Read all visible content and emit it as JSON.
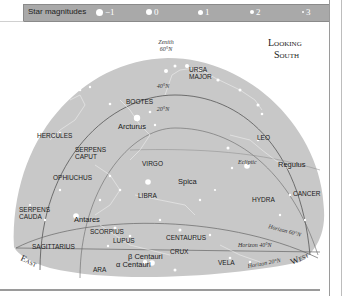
{
  "legend": {
    "title": "Star magnitudes",
    "magnitudes": [
      "−1",
      "0",
      "1",
      "2",
      "3"
    ]
  },
  "heading": {
    "line1": "Looking",
    "line2": "South"
  },
  "zenith": {
    "line1": "Zenith",
    "line2": "60°N"
  },
  "latitude_lines": {
    "lat40": "40°N",
    "lat20": "20°N"
  },
  "horizons": {
    "h60": "Horizon 60°N",
    "h40": "Horizon 40°N",
    "h20": "Horizon 20°N"
  },
  "ecliptic": "Ecliptic",
  "directions": {
    "east": "East",
    "west": "West"
  },
  "constellations": {
    "ursa_major_1": "URSA",
    "ursa_major_2": "MAJOR",
    "bootes": "BOOTES",
    "hercules": "HERCULES",
    "serpens_caput_1": "SERPENS",
    "serpens_caput_2": "CAPUT",
    "virgo": "VIRGO",
    "leo": "LEO",
    "ophiuchus": "OPHIUCHUS",
    "libra": "LIBRA",
    "hydra": "HYDRA",
    "cancer": "CANCER",
    "serpens_cauda_1": "SERPENS",
    "serpens_cauda_2": "CAUDA",
    "scorpius": "SCORPIUS",
    "lupus": "LUPUS",
    "centaurus": "CENTAURUS",
    "sagittarius": "SAGITTARIUS",
    "crux": "CRUX",
    "ara": "ARA",
    "vela": "VELA"
  },
  "stars": {
    "arcturus": "Arcturus",
    "regulus": "Regulus",
    "spica": "Spica",
    "antares": "Antares",
    "beta_centauri": "β Centauri",
    "alpha_centauri": "α Centauri"
  },
  "colors": {
    "sky": "#c8c8c8",
    "legend_bar": "#a9a9a9",
    "line": "#555555",
    "star": "#ffffff"
  }
}
